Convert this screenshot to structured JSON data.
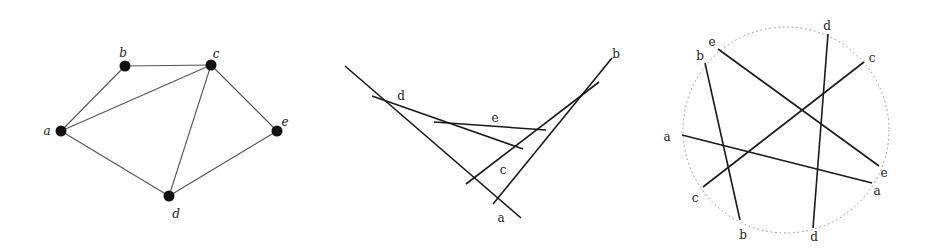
{
  "colors": {
    "line": "#1a1a1a",
    "thin_line": "#555555",
    "node": "#111111",
    "circle": "#888888"
  },
  "panels": [
    {
      "id": "graph",
      "description": "Graph with 5 vertices",
      "nodes": [
        {
          "id": "a",
          "x": 61,
          "y": 131,
          "lx": 47,
          "ly": 131
        },
        {
          "id": "b",
          "x": 125,
          "y": 66,
          "lx": 123,
          "ly": 53
        },
        {
          "id": "c",
          "x": 211,
          "y": 65,
          "lx": 216,
          "ly": 54
        },
        {
          "id": "d",
          "x": 169,
          "y": 196,
          "lx": 176,
          "ly": 214
        },
        {
          "id": "e",
          "x": 277,
          "y": 131,
          "lx": 285,
          "ly": 122
        }
      ],
      "edges": [
        [
          "a",
          "b"
        ],
        [
          "b",
          "c"
        ],
        [
          "a",
          "c"
        ],
        [
          "c",
          "d"
        ],
        [
          "c",
          "e"
        ],
        [
          "a",
          "d"
        ],
        [
          "d",
          "e"
        ]
      ]
    },
    {
      "id": "segments",
      "description": "Segment intersection representation",
      "segments": [
        {
          "id": "a",
          "x1": 345,
          "y1": 66,
          "x2": 521,
          "y2": 218,
          "lx": 501,
          "ly": 218
        },
        {
          "id": "b",
          "x1": 612,
          "y1": 58,
          "x2": 493,
          "y2": 204,
          "lx": 616,
          "ly": 54
        },
        {
          "id": "c",
          "x1": 466,
          "y1": 184,
          "x2": 599,
          "y2": 82,
          "lx": 503,
          "ly": 170
        },
        {
          "id": "d",
          "x1": 372,
          "y1": 96,
          "x2": 523,
          "y2": 149,
          "lx": 401,
          "ly": 96
        },
        {
          "id": "e",
          "x1": 434,
          "y1": 122,
          "x2": 546,
          "y2": 130,
          "lx": 495,
          "ly": 118
        }
      ]
    },
    {
      "id": "circle",
      "description": "Circle graph / chord representation",
      "circle": {
        "cx": 786,
        "cy": 130,
        "r": 103
      },
      "chords": [
        {
          "id": "a",
          "x1": 682,
          "y1": 135,
          "x2": 872,
          "y2": 183
        },
        {
          "id": "b",
          "x1": 705,
          "y1": 63,
          "x2": 740,
          "y2": 220
        },
        {
          "id": "c",
          "x1": 703,
          "y1": 187,
          "x2": 864,
          "y2": 62
        },
        {
          "id": "d",
          "x1": 828,
          "y1": 34,
          "x2": 813,
          "y2": 228
        },
        {
          "id": "e",
          "x1": 718,
          "y1": 49,
          "x2": 879,
          "y2": 166
        }
      ],
      "labels": [
        {
          "text": "e",
          "x": 712,
          "y": 42
        },
        {
          "text": "b",
          "x": 700,
          "y": 56
        },
        {
          "text": "d",
          "x": 827,
          "y": 26
        },
        {
          "text": "c",
          "x": 872,
          "y": 58
        },
        {
          "text": "a",
          "x": 667,
          "y": 137
        },
        {
          "text": "e",
          "x": 884,
          "y": 173
        },
        {
          "text": "a",
          "x": 877,
          "y": 191
        },
        {
          "text": "c",
          "x": 695,
          "y": 198
        },
        {
          "text": "b",
          "x": 743,
          "y": 235
        },
        {
          "text": "d",
          "x": 814,
          "y": 237
        }
      ]
    }
  ]
}
